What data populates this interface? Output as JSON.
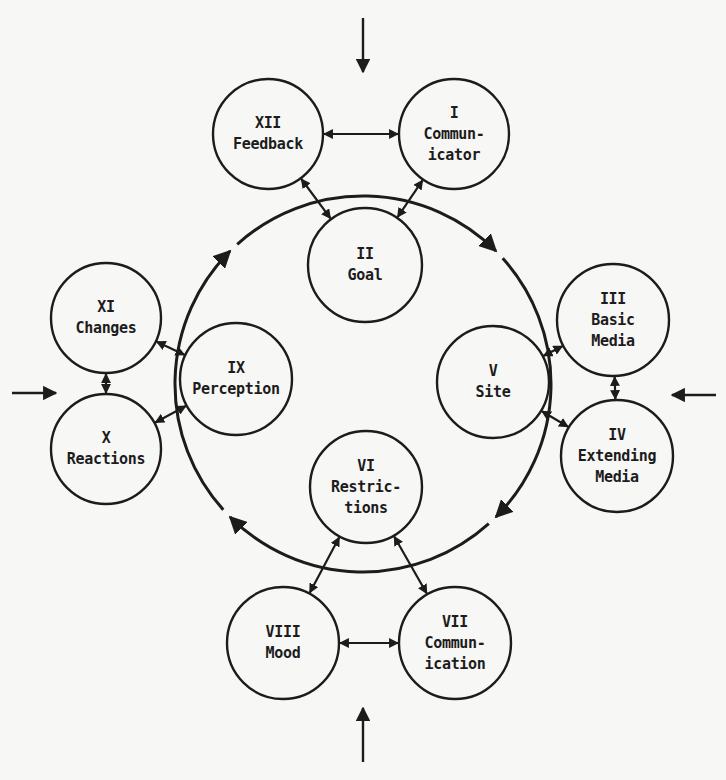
{
  "diagram": {
    "type": "cyclic-process",
    "colors": {
      "ink": "#1c1c1c",
      "background": "#f7f7f5"
    },
    "ring": {
      "cx": 363,
      "cy": 384,
      "r": 188,
      "direction": "clockwise"
    },
    "nodes": [
      {
        "id": "I",
        "numeral": "I",
        "label": "Commun-\nicator",
        "cx": 454,
        "cy": 134,
        "r": 55
      },
      {
        "id": "II",
        "numeral": "II",
        "label": "Goal",
        "cx": 365,
        "cy": 265,
        "r": 57
      },
      {
        "id": "III",
        "numeral": "III",
        "label": "Basic\nMedia",
        "cx": 613,
        "cy": 320,
        "r": 56
      },
      {
        "id": "IV",
        "numeral": "IV",
        "label": "Extending\nMedia",
        "cx": 617,
        "cy": 456,
        "r": 56
      },
      {
        "id": "V",
        "numeral": "V",
        "label": "Site",
        "cx": 493,
        "cy": 382,
        "r": 56
      },
      {
        "id": "VI",
        "numeral": "VI",
        "label": "Restric-\ntions",
        "cx": 366,
        "cy": 487,
        "r": 56
      },
      {
        "id": "VII",
        "numeral": "VII",
        "label": "Commun-\nication",
        "cx": 455,
        "cy": 643,
        "r": 56
      },
      {
        "id": "VIII",
        "numeral": "VIII",
        "label": "Mood",
        "cx": 283,
        "cy": 643,
        "r": 56
      },
      {
        "id": "IX",
        "numeral": "IX",
        "label": "Perception",
        "cx": 236,
        "cy": 379,
        "r": 56
      },
      {
        "id": "X",
        "numeral": "X",
        "label": "Reactions",
        "cx": 106,
        "cy": 449,
        "r": 55
      },
      {
        "id": "XI",
        "numeral": "XI",
        "label": "Changes",
        "cx": 106,
        "cy": 318,
        "r": 55
      },
      {
        "id": "XII",
        "numeral": "XII",
        "label": "Feedback",
        "cx": 268,
        "cy": 134,
        "r": 55
      }
    ],
    "links": [
      {
        "from": "XII",
        "to": "I",
        "type": "bidirectional"
      },
      {
        "from": "XII",
        "to": "II",
        "type": "bidirectional"
      },
      {
        "from": "I",
        "to": "II",
        "type": "bidirectional"
      },
      {
        "from": "III",
        "to": "IV",
        "type": "bidirectional"
      },
      {
        "from": "III",
        "to": "V",
        "type": "bidirectional"
      },
      {
        "from": "IV",
        "to": "V",
        "type": "bidirectional"
      },
      {
        "from": "VI",
        "to": "VIII",
        "type": "bidirectional"
      },
      {
        "from": "VI",
        "to": "VII",
        "type": "bidirectional"
      },
      {
        "from": "VIII",
        "to": "VII",
        "type": "bidirectional"
      },
      {
        "from": "XI",
        "to": "X",
        "type": "bidirectional"
      },
      {
        "from": "XI",
        "to": "IX",
        "type": "bidirectional"
      },
      {
        "from": "X",
        "to": "IX",
        "type": "bidirectional"
      }
    ],
    "external_inputs": [
      {
        "position": "top",
        "x1": 363,
        "y1": 18,
        "x2": 363,
        "y2": 72
      },
      {
        "position": "right",
        "x1": 716,
        "y1": 395,
        "x2": 672,
        "y2": 395
      },
      {
        "position": "bottom",
        "x1": 363,
        "y1": 762,
        "x2": 363,
        "y2": 708
      },
      {
        "position": "left",
        "x1": 12,
        "y1": 393,
        "x2": 56,
        "y2": 393
      }
    ],
    "ring_arrows_deg": [
      -45,
      45,
      135,
      225
    ]
  }
}
